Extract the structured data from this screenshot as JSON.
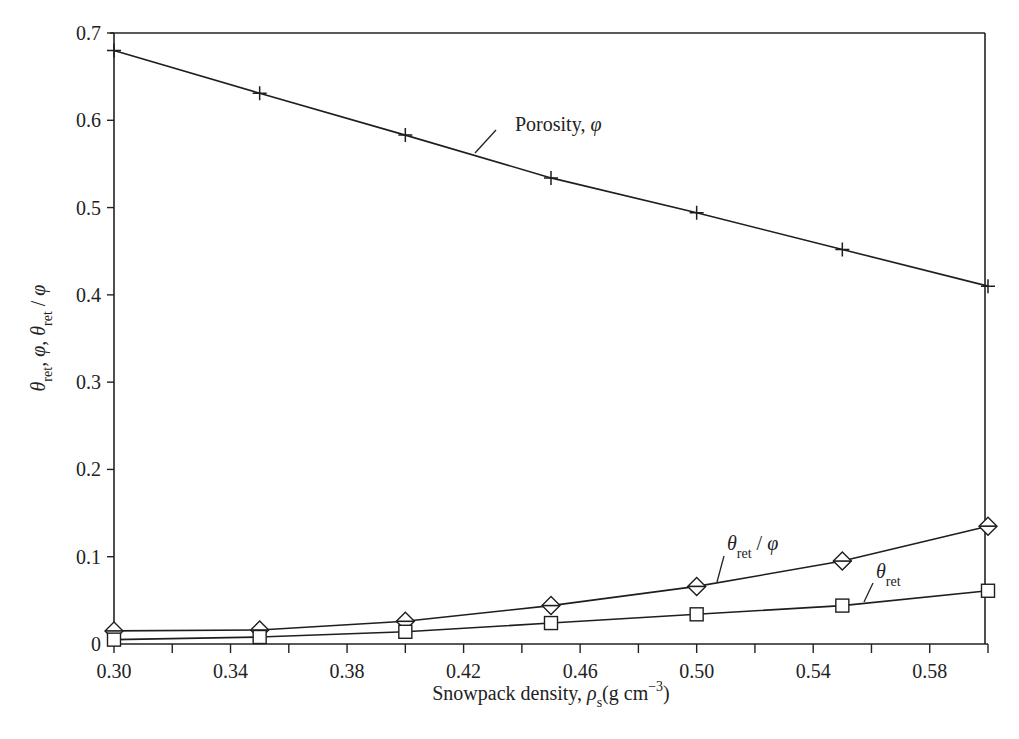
{
  "chart_data": {
    "type": "line",
    "title": "",
    "xlabel": "Snowpack density, ρs(g cm−3)",
    "ylabel": "θret, φ, θret / φ",
    "xlim": [
      0.3,
      0.6
    ],
    "ylim": [
      0,
      0.7
    ],
    "grid": false,
    "legend": "none (inline annotations)",
    "x_major_ticks": [
      0.3,
      0.34,
      0.38,
      0.42,
      0.46,
      0.5,
      0.54,
      0.58
    ],
    "x_minor_ticks": [
      0.32,
      0.36,
      0.4,
      0.44,
      0.48,
      0.52,
      0.56,
      0.6
    ],
    "y_ticks": [
      0,
      0.1,
      0.2,
      0.3,
      0.4,
      0.5,
      0.6,
      0.7
    ],
    "x": [
      0.3,
      0.35,
      0.4,
      0.45,
      0.5,
      0.55,
      0.6
    ],
    "series": [
      {
        "name": "Porosity, φ",
        "marker": "plus",
        "values": [
          0.68,
          0.631,
          0.583,
          0.534,
          0.494,
          0.452,
          0.41
        ]
      },
      {
        "name": "θret / φ",
        "marker": "diamond",
        "values": [
          0.015,
          0.016,
          0.026,
          0.044,
          0.066,
          0.095,
          0.135
        ]
      },
      {
        "name": "θret",
        "marker": "square",
        "values": [
          0.005,
          0.008,
          0.014,
          0.024,
          0.034,
          0.044,
          0.061
        ]
      }
    ],
    "annotations": [
      {
        "text": "Porosity, φ",
        "series": 0
      },
      {
        "text": "θret / φ",
        "series": 1
      },
      {
        "text": "θret",
        "series": 2
      }
    ]
  },
  "labels": {
    "x_tick_labels": [
      "0.30",
      "0.34",
      "0.38",
      "0.42",
      "0.46",
      "0.50",
      "0.54",
      "0.58"
    ],
    "y_tick_labels": [
      "0",
      "0.1",
      "0.2",
      "0.3",
      "0.4",
      "0.5",
      "0.6",
      "0.7"
    ],
    "xlabel_main": "Snowpack density, ",
    "xlabel_rho": "ρ",
    "xlabel_sub": "s",
    "xlabel_unit": "(g cm",
    "xlabel_exp": "−3",
    "xlabel_close": ")",
    "ylabel_theta": "θ",
    "ylabel_sub": "ret",
    "ylabel_sep": ", ",
    "ylabel_phi": "φ",
    "ylabel_slash": " / ",
    "annot_porosity_text": "Porosity, ",
    "annot_porosity_phi": "φ",
    "annot_ratio_theta": "θ",
    "annot_ratio_sub": "ret",
    "annot_ratio_slash": " / ",
    "annot_ratio_phi": "φ",
    "annot_ret_theta": "θ",
    "annot_ret_sub": "ret"
  }
}
